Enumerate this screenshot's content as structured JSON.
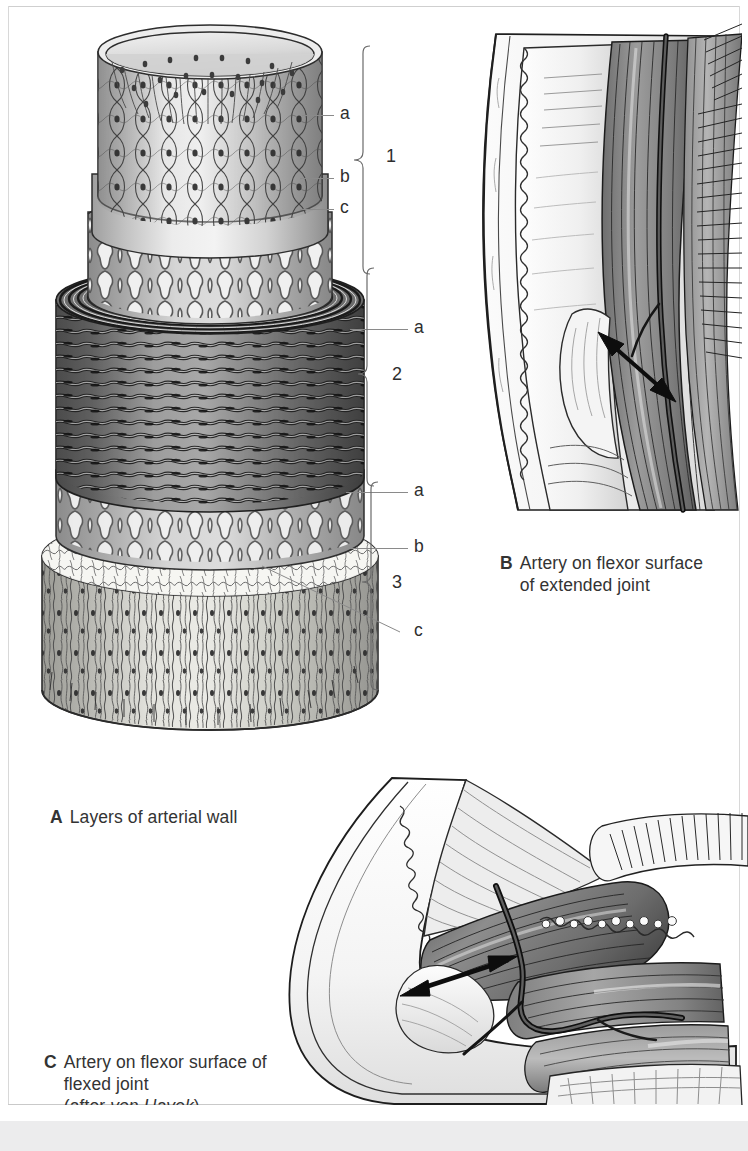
{
  "plate": {
    "panels": [
      {
        "id": "A",
        "letter": "A",
        "caption_line1": "Layers of arterial wall",
        "caption_lines": [
          "Layers of arterial wall"
        ],
        "source": ""
      },
      {
        "id": "B",
        "letter": "B",
        "caption_line1": "Artery on flexor surface",
        "caption_line2": "of extended joint",
        "caption_lines": [
          "Artery on flexor surface",
          "of extended joint"
        ],
        "source": ""
      },
      {
        "id": "C",
        "letter": "C",
        "caption_line1": "Artery on flexor surface of",
        "caption_line2": "flexed joint",
        "caption_line3_pre": "(after ",
        "caption_line3_italic": "von Hayek",
        "caption_line3_post": ")",
        "caption_lines": [
          "Artery on flexor surface of",
          "flexed joint",
          "(after von Hayek)"
        ],
        "source": "von Hayek"
      }
    ],
    "panel_a_labels": {
      "layer1": {
        "number": "1",
        "items": [
          {
            "key": "a",
            "label": "a"
          },
          {
            "key": "b",
            "label": "b"
          },
          {
            "key": "c",
            "label": "c"
          }
        ]
      },
      "layer2": {
        "number": "2",
        "items": [
          {
            "key": "a",
            "label": "a"
          }
        ]
      },
      "layer3": {
        "number": "3",
        "items": [
          {
            "key": "a",
            "label": "a"
          },
          {
            "key": "b",
            "label": "b"
          },
          {
            "key": "c",
            "label": "c"
          }
        ]
      }
    },
    "colors": {
      "background": "#ffffff",
      "ink": "#2e2e2e",
      "leader": "#8a8a8a",
      "caption_text": "#333333",
      "tunica_intima": "#b9b9b9",
      "tunica_media": "#6f6f6f",
      "tunica_adventitia": "#c6c6c2",
      "footer_band": "#ececed",
      "arrow": "#111111"
    }
  }
}
